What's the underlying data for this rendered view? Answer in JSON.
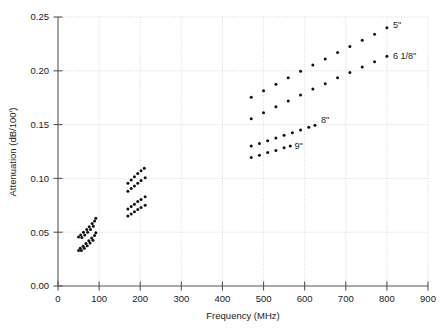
{
  "chart_data": {
    "type": "scatter",
    "title": "",
    "xlabel": "Frequency (MHz)",
    "ylabel": "Attenuation (dB/100')",
    "xlim": [
      0,
      900
    ],
    "ylim": [
      0.0,
      0.25
    ],
    "xticks": [
      0,
      100,
      200,
      300,
      400,
      500,
      600,
      700,
      800,
      900
    ],
    "xticklabels": [
      "0",
      "100",
      "200",
      "300",
      "400",
      "500",
      "600",
      "700",
      "800",
      "900"
    ],
    "yticks": [
      0.0,
      0.05,
      0.1,
      0.15,
      0.2,
      0.25
    ],
    "yticklabels": [
      "0.00",
      "0.05",
      "0.10",
      "0.15",
      "0.20",
      "0.25"
    ],
    "grid": true,
    "grid_style": "dotted",
    "grid_color": "#c8c8c8",
    "marker_color": "#111111",
    "legend": "inline-labels",
    "legend_position": "right-of-series",
    "series": [
      {
        "name": "5\"",
        "label": "5\"",
        "label_x": 815,
        "label_y": 0.2425,
        "points": [
          {
            "x": 470,
            "y": 0.1755
          },
          {
            "x": 500,
            "y": 0.1815
          },
          {
            "x": 530,
            "y": 0.1875
          },
          {
            "x": 560,
            "y": 0.1935
          },
          {
            "x": 590,
            "y": 0.1995
          },
          {
            "x": 620,
            "y": 0.2055
          },
          {
            "x": 650,
            "y": 0.211
          },
          {
            "x": 680,
            "y": 0.217
          },
          {
            "x": 710,
            "y": 0.2225
          },
          {
            "x": 740,
            "y": 0.2285
          },
          {
            "x": 770,
            "y": 0.234
          },
          {
            "x": 800,
            "y": 0.24
          }
        ]
      },
      {
        "name": "6 1/8\"",
        "label": "6 1/8\"",
        "label_x": 815,
        "label_y": 0.214,
        "points": [
          {
            "x": 470,
            "y": 0.1555
          },
          {
            "x": 500,
            "y": 0.161
          },
          {
            "x": 530,
            "y": 0.1665
          },
          {
            "x": 560,
            "y": 0.172
          },
          {
            "x": 590,
            "y": 0.1775
          },
          {
            "x": 620,
            "y": 0.183
          },
          {
            "x": 650,
            "y": 0.188
          },
          {
            "x": 680,
            "y": 0.1935
          },
          {
            "x": 710,
            "y": 0.1985
          },
          {
            "x": 740,
            "y": 0.2035
          },
          {
            "x": 770,
            "y": 0.2085
          },
          {
            "x": 800,
            "y": 0.2135
          }
        ]
      },
      {
        "name": "8\"",
        "label": "8\"",
        "label_x": 640,
        "label_y": 0.1545,
        "points": [
          {
            "x": 470,
            "y": 0.13
          },
          {
            "x": 490,
            "y": 0.1325
          },
          {
            "x": 510,
            "y": 0.135
          },
          {
            "x": 530,
            "y": 0.1375
          },
          {
            "x": 550,
            "y": 0.14
          },
          {
            "x": 570,
            "y": 0.1425
          },
          {
            "x": 590,
            "y": 0.145
          },
          {
            "x": 610,
            "y": 0.1475
          },
          {
            "x": 625,
            "y": 0.1495
          }
        ]
      },
      {
        "name": "9\"",
        "label": "9\"",
        "label_x": 575,
        "label_y": 0.13,
        "points": [
          {
            "x": 470,
            "y": 0.1195
          },
          {
            "x": 490,
            "y": 0.1215
          },
          {
            "x": 510,
            "y": 0.124
          },
          {
            "x": 530,
            "y": 0.126
          },
          {
            "x": 550,
            "y": 0.1285
          },
          {
            "x": 565,
            "y": 0.13
          }
        ]
      },
      {
        "name": "mid-band-upper-a",
        "label": "",
        "points": [
          {
            "x": 170,
            "y": 0.0955
          },
          {
            "x": 178,
            "y": 0.0985
          },
          {
            "x": 186,
            "y": 0.1015
          },
          {
            "x": 194,
            "y": 0.1045
          },
          {
            "x": 202,
            "y": 0.107
          },
          {
            "x": 210,
            "y": 0.1095
          }
        ]
      },
      {
        "name": "mid-band-upper-b",
        "label": "",
        "points": [
          {
            "x": 170,
            "y": 0.088
          },
          {
            "x": 178,
            "y": 0.0905
          },
          {
            "x": 186,
            "y": 0.093
          },
          {
            "x": 194,
            "y": 0.0955
          },
          {
            "x": 202,
            "y": 0.098
          },
          {
            "x": 212,
            "y": 0.1005
          }
        ]
      },
      {
        "name": "mid-band-lower-a",
        "label": "",
        "points": [
          {
            "x": 170,
            "y": 0.0715
          },
          {
            "x": 178,
            "y": 0.074
          },
          {
            "x": 186,
            "y": 0.076
          },
          {
            "x": 194,
            "y": 0.0785
          },
          {
            "x": 202,
            "y": 0.0805
          },
          {
            "x": 212,
            "y": 0.083
          }
        ]
      },
      {
        "name": "mid-band-lower-b",
        "label": "",
        "points": [
          {
            "x": 170,
            "y": 0.065
          },
          {
            "x": 178,
            "y": 0.067
          },
          {
            "x": 186,
            "y": 0.069
          },
          {
            "x": 194,
            "y": 0.071
          },
          {
            "x": 202,
            "y": 0.073
          },
          {
            "x": 212,
            "y": 0.075
          }
        ]
      },
      {
        "name": "low-band-upper",
        "label": "",
        "points": [
          {
            "x": 50,
            "y": 0.0455
          },
          {
            "x": 55,
            "y": 0.0475
          },
          {
            "x": 58,
            "y": 0.045
          },
          {
            "x": 62,
            "y": 0.05
          },
          {
            "x": 65,
            "y": 0.0475
          },
          {
            "x": 70,
            "y": 0.0525
          },
          {
            "x": 72,
            "y": 0.05
          },
          {
            "x": 76,
            "y": 0.055
          },
          {
            "x": 79,
            "y": 0.0525
          },
          {
            "x": 83,
            "y": 0.058
          },
          {
            "x": 86,
            "y": 0.0555
          },
          {
            "x": 89,
            "y": 0.0605
          },
          {
            "x": 92,
            "y": 0.063
          }
        ]
      },
      {
        "name": "low-band-lower",
        "label": "",
        "points": [
          {
            "x": 50,
            "y": 0.033
          },
          {
            "x": 54,
            "y": 0.035
          },
          {
            "x": 57,
            "y": 0.033
          },
          {
            "x": 61,
            "y": 0.037
          },
          {
            "x": 64,
            "y": 0.035
          },
          {
            "x": 68,
            "y": 0.0395
          },
          {
            "x": 71,
            "y": 0.0375
          },
          {
            "x": 75,
            "y": 0.042
          },
          {
            "x": 78,
            "y": 0.04
          },
          {
            "x": 82,
            "y": 0.0445
          },
          {
            "x": 85,
            "y": 0.0425
          },
          {
            "x": 89,
            "y": 0.047
          },
          {
            "x": 92,
            "y": 0.0495
          }
        ]
      }
    ]
  },
  "caption": ""
}
